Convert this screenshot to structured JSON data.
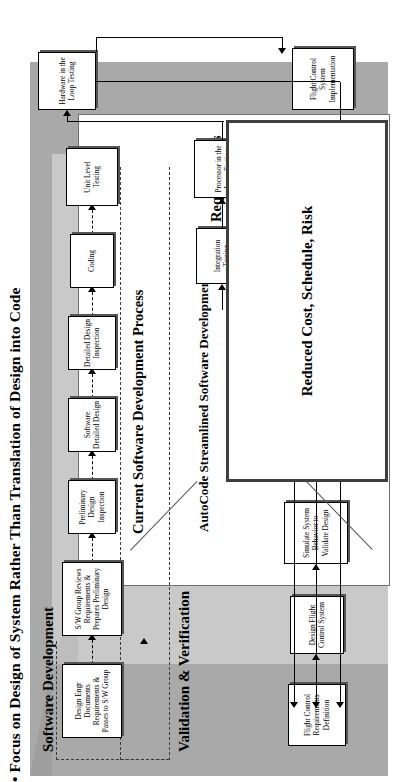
{
  "slide": {
    "title": "• Focus on Design of System Rather Than Translation of Design into Code"
  },
  "bands": {
    "software_development": "Software Development",
    "validation_verification": "Validation & Verification"
  },
  "panels": {
    "current_process_label": "Current Software Development Process",
    "autocode_process_label": "AutoCode Streamlined Software Development Process",
    "requirements_label": "Requirements"
  },
  "benefit": {
    "text": "Reduced Cost, Schedule, Risk"
  },
  "current_process": {
    "boxes": [
      {
        "id": "design-engr-documents",
        "label": "Design Engr Documents Requirements & Passes to S/W Group"
      },
      {
        "id": "sw-group-reviews",
        "label": "S/W Group Reviews Requirements & Prepares Preliminary Design"
      },
      {
        "id": "preliminary-design-inspection",
        "label": "Preliminary Design Inspection"
      },
      {
        "id": "software-detailed-design",
        "label": "Software Detailed Design"
      },
      {
        "id": "detailed-design-inspection",
        "label": "Detailed Design Inspection"
      },
      {
        "id": "coding",
        "label": "Coding"
      },
      {
        "id": "unit-level-testing",
        "label": "Unit Level Testing"
      }
    ]
  },
  "autocode_process": {
    "boxes": [
      {
        "id": "flight-control-requirements-definition",
        "label": "Flight Control Requirements Definition"
      },
      {
        "id": "design-flight-control-system",
        "label": "Design Flight Control System"
      },
      {
        "id": "simulate-system-behavior",
        "label": "Simulate System Behavior to Validate Design"
      },
      {
        "id": "generate-autocode",
        "label": "Generate AutoCode"
      },
      {
        "id": "unit-test-sw-automated",
        "label": "Unit Test S/W Using Automated Process"
      }
    ]
  },
  "verification": {
    "boxes": [
      {
        "id": "integration-testing",
        "label": "Integration Testing"
      },
      {
        "id": "processor-in-the-loop-testing",
        "label": "Processor in the Loop Testing"
      },
      {
        "id": "hardware-in-the-loop-testing",
        "label": "Hardware in the Loop Testing"
      },
      {
        "id": "flight-control-system-implementation",
        "label": "Flight Control System Implementation"
      }
    ]
  }
}
